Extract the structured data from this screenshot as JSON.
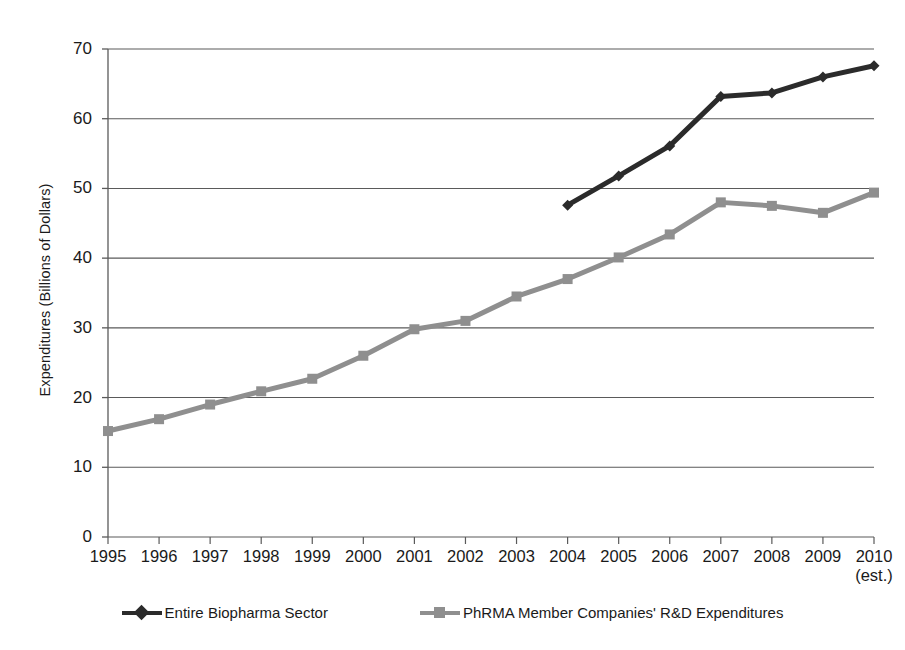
{
  "chart_data": {
    "type": "line",
    "title": "",
    "xlabel": "",
    "ylabel": "Expenditures (Billions of Dollars)",
    "categories": [
      "1995",
      "1996",
      "1997",
      "1998",
      "1999",
      "2000",
      "2001",
      "2002",
      "2003",
      "2004",
      "2005",
      "2006",
      "2007",
      "2008",
      "2009",
      "2010\n(est.)"
    ],
    "x_tick_labels": [
      "1995",
      "1996",
      "1997",
      "1998",
      "1999",
      "2000",
      "2001",
      "2002",
      "2003",
      "2004",
      "2005",
      "2006",
      "2007",
      "2008",
      "2009",
      "2010\n(est.)"
    ],
    "y_tick_labels": [
      "70",
      "60",
      "50",
      "40",
      "30",
      "20",
      "10",
      "0"
    ],
    "y_ticks": [
      70,
      60,
      50,
      40,
      30,
      20,
      10,
      0
    ],
    "ylim": [
      0,
      70
    ],
    "grid": "horizontal",
    "legend_position": "bottom",
    "series": [
      {
        "name": "Entire Biopharma Sector",
        "color": "#2b2b2b",
        "marker": "diamond",
        "values": [
          null,
          null,
          null,
          null,
          null,
          null,
          null,
          null,
          null,
          47.6,
          51.8,
          56.1,
          63.2,
          63.7,
          66.0,
          67.6
        ]
      },
      {
        "name": "PhRMA Member Companies' R&D Expenditures",
        "color": "#8f8f8f",
        "marker": "square",
        "values": [
          15.2,
          16.9,
          19.0,
          20.9,
          22.7,
          26.0,
          29.8,
          31.0,
          34.5,
          37.0,
          40.1,
          43.4,
          48.0,
          47.5,
          46.5,
          49.4
        ]
      }
    ]
  },
  "legend": {
    "entries": [
      {
        "label": "Entire Biopharma Sector",
        "color": "#2b2b2b",
        "marker": "diamond"
      },
      {
        "label": "PhRMA Member Companies' R&D Expenditures",
        "color": "#8f8f8f",
        "marker": "square"
      }
    ]
  },
  "axes": {
    "axis_color": "#5a5a5a",
    "grid_color": "#5a5a5a",
    "text_color": "#1a1a1a"
  }
}
